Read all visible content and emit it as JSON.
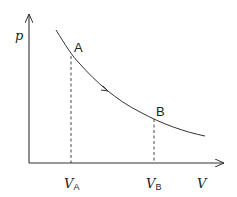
{
  "diagram": {
    "type": "p-V process curve",
    "axes": {
      "y_label": "p",
      "x_label": "V"
    },
    "points": [
      {
        "name": "A",
        "label": "A",
        "x_tick": {
          "main": "V",
          "sub": "A"
        }
      },
      {
        "name": "B",
        "label": "B",
        "x_tick": {
          "main": "V",
          "sub": "B"
        }
      }
    ],
    "curve": {
      "description": "decreasing hyperbola-like curve from A to B",
      "direction": "A to B"
    },
    "colors": {
      "line": "#333333",
      "background": "#ffffff"
    }
  }
}
